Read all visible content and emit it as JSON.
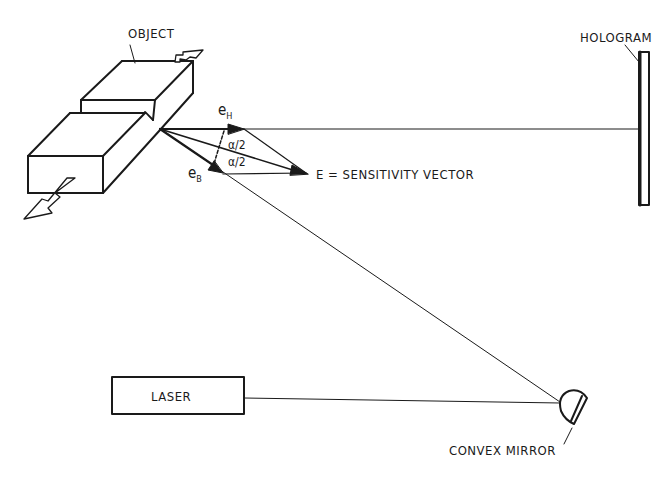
{
  "diagram": {
    "type": "holographic interferometry setup",
    "labels": {
      "object": "OBJECT",
      "hologram": "HOLOGRAM",
      "laser": "LASER",
      "convex_mirror": "CONVEX MIRROR",
      "sensitivity_vector": "E = SENSITIVITY VECTOR"
    },
    "vectors": {
      "observation": {
        "base": "e",
        "subscript": "H"
      },
      "illumination": {
        "base": "e",
        "subscript": "B"
      },
      "half_angle_top": "α/2",
      "half_angle_bottom": "α/2"
    },
    "colors": {
      "ink": "#1a1a1a",
      "background": "#ffffff"
    }
  }
}
